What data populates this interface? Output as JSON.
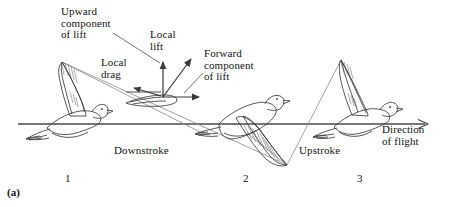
{
  "figure": {
    "panel_label": "(a)",
    "caption_numbers": [
      "1",
      "2",
      "3"
    ],
    "stroke_color": "#333333",
    "line_color": "#4a4a4a",
    "background": "#ffffff"
  },
  "labels": {
    "upward_component": "Upward\ncomponent\nof lift",
    "local_lift": "Local\nlift",
    "local_drag": "Local\ndrag",
    "forward_component": "Forward\ncomponent\nof lift",
    "downstroke": "Downstroke",
    "upstroke": "Upstroke",
    "direction_of_flight": "Direction\nof flight"
  },
  "numbers": {
    "bird_one": "1",
    "bird_two": "2",
    "bird_three": "3"
  },
  "vectors": [
    {
      "name": "upward-component-of-lift",
      "direction": "up",
      "label": "Upward component of lift"
    },
    {
      "name": "local-lift",
      "direction": "up-right",
      "label": "Local lift"
    },
    {
      "name": "local-drag",
      "direction": "left",
      "label": "Local drag"
    },
    {
      "name": "forward-component-of-lift",
      "direction": "right",
      "label": "Forward component of lift"
    }
  ],
  "birds": [
    {
      "index": "1",
      "phase": "wings-up",
      "position": "left"
    },
    {
      "index": "2",
      "phase": "wings-down",
      "position": "center"
    },
    {
      "index": "3",
      "phase": "wings-up",
      "position": "right"
    }
  ]
}
